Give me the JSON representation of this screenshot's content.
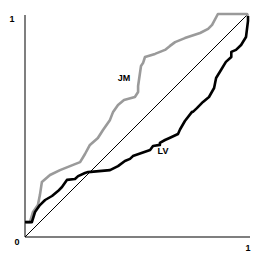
{
  "chart_data": {
    "type": "line",
    "title": "",
    "xlabel": "",
    "ylabel": "",
    "xlim": [
      0,
      1
    ],
    "ylim": [
      0,
      1
    ],
    "grid": false,
    "legend": "inline labels",
    "tick_labels": {
      "origin": "0",
      "x_end": "1",
      "y_end": "1"
    },
    "series": [
      {
        "name": "JM",
        "color": "#9a9a9a",
        "label_pos": [
          0.444,
          0.713
        ],
        "points": [
          [
            0.0,
            0.067
          ],
          [
            0.022,
            0.067
          ],
          [
            0.036,
            0.112
          ],
          [
            0.058,
            0.143
          ],
          [
            0.067,
            0.188
          ],
          [
            0.076,
            0.247
          ],
          [
            0.112,
            0.278
          ],
          [
            0.157,
            0.3
          ],
          [
            0.224,
            0.327
          ],
          [
            0.247,
            0.336
          ],
          [
            0.269,
            0.372
          ],
          [
            0.291,
            0.413
          ],
          [
            0.327,
            0.444
          ],
          [
            0.35,
            0.48
          ],
          [
            0.381,
            0.525
          ],
          [
            0.395,
            0.561
          ],
          [
            0.417,
            0.592
          ],
          [
            0.444,
            0.614
          ],
          [
            0.493,
            0.628
          ],
          [
            0.507,
            0.65
          ],
          [
            0.507,
            0.677
          ],
          [
            0.52,
            0.767
          ],
          [
            0.529,
            0.78
          ],
          [
            0.538,
            0.807
          ],
          [
            0.583,
            0.821
          ],
          [
            0.628,
            0.839
          ],
          [
            0.65,
            0.857
          ],
          [
            0.673,
            0.874
          ],
          [
            0.717,
            0.892
          ],
          [
            0.785,
            0.915
          ],
          [
            0.821,
            0.933
          ],
          [
            0.839,
            0.951
          ],
          [
            0.865,
            1.0
          ],
          [
            0.978,
            1.0
          ],
          [
            0.996,
            1.0
          ],
          [
            1.0,
            0.991
          ]
        ]
      },
      {
        "name": "LV",
        "color": "#000000",
        "label_pos": [
          0.612,
          0.39
        ],
        "points": [
          [
            0.0,
            0.067
          ],
          [
            0.031,
            0.067
          ],
          [
            0.045,
            0.112
          ],
          [
            0.067,
            0.143
          ],
          [
            0.09,
            0.166
          ],
          [
            0.121,
            0.184
          ],
          [
            0.148,
            0.206
          ],
          [
            0.166,
            0.224
          ],
          [
            0.188,
            0.256
          ],
          [
            0.224,
            0.26
          ],
          [
            0.238,
            0.273
          ],
          [
            0.269,
            0.287
          ],
          [
            0.283,
            0.291
          ],
          [
            0.381,
            0.3
          ],
          [
            0.417,
            0.318
          ],
          [
            0.448,
            0.341
          ],
          [
            0.471,
            0.35
          ],
          [
            0.484,
            0.363
          ],
          [
            0.561,
            0.39
          ],
          [
            0.574,
            0.408
          ],
          [
            0.605,
            0.413
          ],
          [
            0.605,
            0.422
          ],
          [
            0.628,
            0.435
          ],
          [
            0.648,
            0.444
          ],
          [
            0.686,
            0.462
          ],
          [
            0.695,
            0.482
          ],
          [
            0.717,
            0.52
          ],
          [
            0.749,
            0.561
          ],
          [
            0.753,
            0.561
          ],
          [
            0.771,
            0.578
          ],
          [
            0.798,
            0.606
          ],
          [
            0.825,
            0.628
          ],
          [
            0.848,
            0.668
          ],
          [
            0.857,
            0.713
          ],
          [
            0.879,
            0.749
          ],
          [
            0.901,
            0.785
          ],
          [
            0.925,
            0.807
          ],
          [
            0.925,
            0.83
          ],
          [
            0.946,
            0.839
          ],
          [
            0.969,
            0.861
          ],
          [
            0.991,
            0.897
          ],
          [
            1.0,
            0.969
          ],
          [
            1.0,
            0.991
          ]
        ]
      },
      {
        "name": "diagonal",
        "color": "#000000",
        "points": [
          [
            0,
            0
          ],
          [
            1,
            1
          ]
        ]
      }
    ]
  },
  "labels": {
    "origin": "0",
    "x_end": "1",
    "y_end": "1",
    "series_jm": "JM",
    "series_lv": "LV"
  }
}
